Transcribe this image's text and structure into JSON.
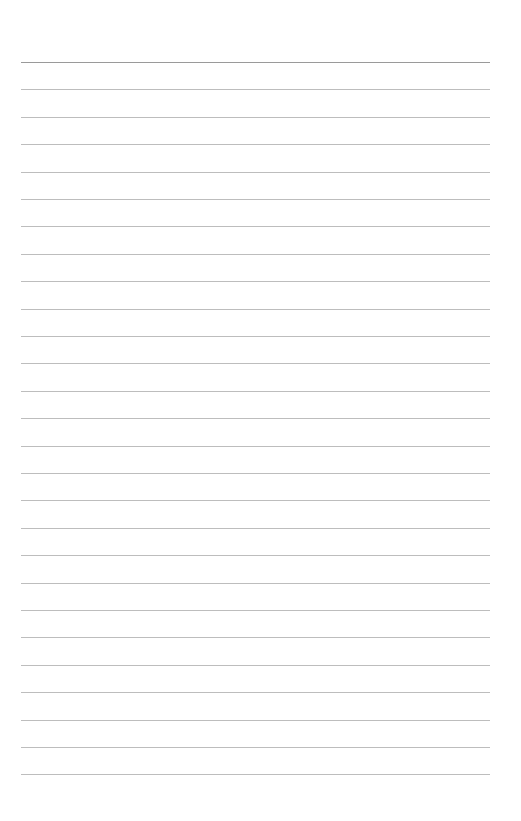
{
  "page": {
    "type": "lined-paper",
    "background_color": "#ffffff",
    "line_color": "#bdbdbd",
    "top_line_color": "#9a9a9a",
    "line_count": 27,
    "first_line_y": 62,
    "line_spacing": 27.4,
    "line_left": 21,
    "line_width": 469
  }
}
